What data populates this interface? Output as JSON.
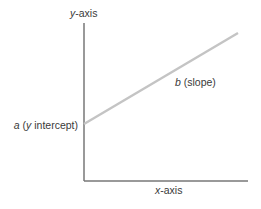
{
  "diagram": {
    "labels": {
      "y_axis": {
        "var": "y",
        "suffix": "-axis"
      },
      "x_axis": {
        "var": "x",
        "suffix": "-axis"
      },
      "intercept": {
        "var": "a",
        "text_open": " (",
        "var2": "y",
        "text_close": " intercept)"
      },
      "slope": {
        "var": "b",
        "text": " (slope)"
      }
    },
    "geometry": {
      "y_axis": {
        "x": 84,
        "y1": 23,
        "y2": 181
      },
      "x_axis": {
        "y": 181,
        "x1": 84,
        "x2": 248
      },
      "regression_line": {
        "x1": 84,
        "y1": 124,
        "x2": 238,
        "y2": 33
      }
    },
    "colors": {
      "axis": "#555555",
      "line": "#c4c4c4",
      "text": "#3a3a3a"
    }
  }
}
